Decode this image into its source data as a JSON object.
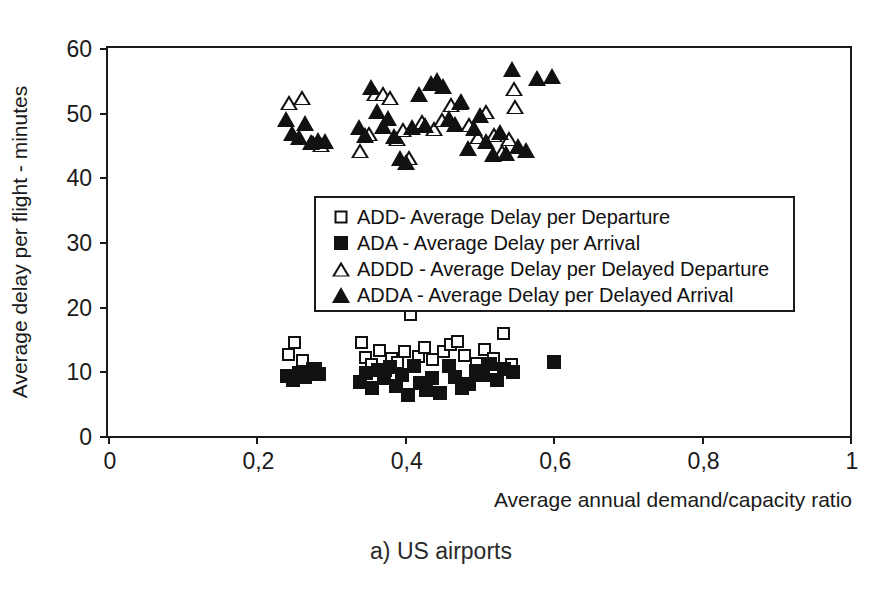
{
  "figure": {
    "caption": "a) US airports",
    "top_sliver_text": "",
    "frame_color": "#1a1a1a",
    "marker_color": "#111111",
    "background": "#ffffff"
  },
  "chart_data": {
    "type": "scatter",
    "title": "",
    "caption": "a) US airports",
    "xlabel": "Average annual demand/capacity ratio",
    "ylabel": "Average delay per flight - minutes",
    "xlim": [
      0,
      1
    ],
    "ylim": [
      0,
      60
    ],
    "xticks": [
      0,
      0.2,
      0.4,
      0.6,
      0.8,
      1
    ],
    "xtick_labels": [
      "0",
      "0,2",
      "0,4",
      "0,6",
      "0,8",
      "1"
    ],
    "yticks": [
      0,
      10,
      20,
      30,
      40,
      50,
      60
    ],
    "ytick_labels": [
      "0",
      "10",
      "20",
      "30",
      "40",
      "50",
      "60"
    ],
    "grid": false,
    "decimal_separator": ",",
    "legend_position": "center",
    "series": [
      {
        "name": "ADD- Average Delay per Departure",
        "abbrev": "ADD",
        "marker": "open-square",
        "points": [
          [
            0.243,
            12.6
          ],
          [
            0.252,
            14.4
          ],
          [
            0.262,
            11.6
          ],
          [
            0.279,
            10.4
          ],
          [
            0.342,
            14.4
          ],
          [
            0.347,
            12.2
          ],
          [
            0.355,
            11.0
          ],
          [
            0.366,
            13.2
          ],
          [
            0.374,
            10.1
          ],
          [
            0.382,
            12.0
          ],
          [
            0.39,
            11.4
          ],
          [
            0.399,
            13.1
          ],
          [
            0.408,
            18.8
          ],
          [
            0.418,
            12.3
          ],
          [
            0.427,
            13.7
          ],
          [
            0.437,
            11.9
          ],
          [
            0.452,
            13.0
          ],
          [
            0.462,
            14.1
          ],
          [
            0.471,
            14.6
          ],
          [
            0.481,
            12.5
          ],
          [
            0.497,
            11.2
          ],
          [
            0.508,
            13.4
          ],
          [
            0.52,
            12.0
          ],
          [
            0.533,
            15.9
          ],
          [
            0.544,
            11.0
          ]
        ]
      },
      {
        "name": "ADA - Average Delay per Arrival",
        "abbrev": "ADA",
        "marker": "filled-square",
        "points": [
          [
            0.241,
            9.3
          ],
          [
            0.249,
            8.6
          ],
          [
            0.257,
            9.8
          ],
          [
            0.266,
            9.1
          ],
          [
            0.276,
            10.3
          ],
          [
            0.285,
            9.6
          ],
          [
            0.34,
            8.4
          ],
          [
            0.348,
            9.7
          ],
          [
            0.356,
            7.5
          ],
          [
            0.364,
            10.2
          ],
          [
            0.372,
            8.9
          ],
          [
            0.38,
            10.6
          ],
          [
            0.388,
            7.8
          ],
          [
            0.396,
            9.4
          ],
          [
            0.404,
            6.4
          ],
          [
            0.412,
            10.8
          ],
          [
            0.42,
            8.2
          ],
          [
            0.428,
            7.1
          ],
          [
            0.436,
            9.0
          ],
          [
            0.447,
            6.6
          ],
          [
            0.459,
            10.9
          ],
          [
            0.468,
            9.2
          ],
          [
            0.477,
            7.4
          ],
          [
            0.487,
            8.0
          ],
          [
            0.496,
            10.0
          ],
          [
            0.505,
            9.5
          ],
          [
            0.515,
            11.1
          ],
          [
            0.524,
            8.7
          ],
          [
            0.534,
            10.4
          ],
          [
            0.546,
            9.9
          ],
          [
            0.601,
            11.5
          ]
        ]
      },
      {
        "name": "ADDD - Average Delay per Delayed Departure",
        "abbrev": "ADDD",
        "marker": "open-triangle",
        "points": [
          [
            0.244,
            51.6
          ],
          [
            0.262,
            52.3
          ],
          [
            0.276,
            45.4
          ],
          [
            0.287,
            45.1
          ],
          [
            0.339,
            44.2
          ],
          [
            0.352,
            46.8
          ],
          [
            0.36,
            53.0
          ],
          [
            0.371,
            52.9
          ],
          [
            0.38,
            52.4
          ],
          [
            0.389,
            46.0
          ],
          [
            0.398,
            47.4
          ],
          [
            0.406,
            43.0
          ],
          [
            0.423,
            48.7
          ],
          [
            0.439,
            47.6
          ],
          [
            0.45,
            49.0
          ],
          [
            0.462,
            51.3
          ],
          [
            0.474,
            51.6
          ],
          [
            0.486,
            48.2
          ],
          [
            0.498,
            46.3
          ],
          [
            0.51,
            50.2
          ],
          [
            0.52,
            46.7
          ],
          [
            0.531,
            44.0
          ],
          [
            0.541,
            46.0
          ],
          [
            0.547,
            53.8
          ],
          [
            0.549,
            51.0
          ]
        ]
      },
      {
        "name": "ADDA - Average Delay per Delayed Arrival",
        "abbrev": "ADDA",
        "marker": "filled-triangle",
        "points": [
          [
            0.24,
            49.0
          ],
          [
            0.248,
            46.8
          ],
          [
            0.257,
            46.2
          ],
          [
            0.265,
            48.4
          ],
          [
            0.273,
            45.5
          ],
          [
            0.283,
            45.8
          ],
          [
            0.292,
            45.6
          ],
          [
            0.338,
            47.8
          ],
          [
            0.346,
            46.6
          ],
          [
            0.354,
            54.0
          ],
          [
            0.362,
            50.2
          ],
          [
            0.37,
            48.0
          ],
          [
            0.378,
            49.1
          ],
          [
            0.386,
            46.4
          ],
          [
            0.394,
            43.0
          ],
          [
            0.402,
            42.4
          ],
          [
            0.41,
            47.8
          ],
          [
            0.419,
            52.9
          ],
          [
            0.427,
            48.1
          ],
          [
            0.435,
            54.6
          ],
          [
            0.443,
            55.0
          ],
          [
            0.452,
            54.2
          ],
          [
            0.46,
            49.2
          ],
          [
            0.468,
            48.3
          ],
          [
            0.476,
            51.8
          ],
          [
            0.485,
            44.6
          ],
          [
            0.493,
            47.6
          ],
          [
            0.502,
            49.6
          ],
          [
            0.51,
            45.6
          ],
          [
            0.519,
            43.6
          ],
          [
            0.528,
            47.0
          ],
          [
            0.536,
            43.8
          ],
          [
            0.545,
            56.8
          ],
          [
            0.552,
            44.8
          ],
          [
            0.563,
            44.2
          ],
          [
            0.578,
            55.4
          ],
          [
            0.598,
            55.6
          ]
        ]
      }
    ]
  }
}
